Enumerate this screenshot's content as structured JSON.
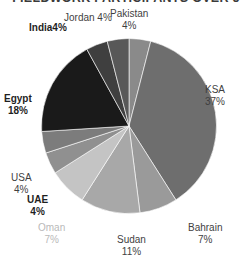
{
  "chart_data": {
    "type": "pie",
    "title": "FIELDWORK PARTICIPANTS OVER 5",
    "xlabel": "",
    "ylabel": "",
    "legend": "none",
    "labels_position": "outside",
    "value_unit": "%",
    "start_angle_deg": 0,
    "direction": "clockwise",
    "categories": [
      "Pakistan",
      "KSA",
      "Bahrain",
      "Sudan",
      "Oman",
      "UAE",
      "USA",
      "Egypt",
      "India",
      "Jordan"
    ],
    "values": [
      4,
      37,
      7,
      11,
      7,
      4,
      4,
      18,
      4,
      4
    ],
    "slices": [
      {
        "name": "Pakistan",
        "value": 4,
        "label": "Pakistan",
        "percent": "4%",
        "color": "#8a8a8a"
      },
      {
        "name": "KSA",
        "value": 37,
        "label": "KSA",
        "percent": "37%",
        "color": "#6e6e6e"
      },
      {
        "name": "Bahrain",
        "value": 7,
        "label": "Bahrain",
        "percent": "7%",
        "color": "#9a9a9a"
      },
      {
        "name": "Sudan",
        "value": 11,
        "label": "Sudan",
        "percent": "11%",
        "color": "#a8a8a8"
      },
      {
        "name": "Oman",
        "value": 7,
        "label": "Oman",
        "percent": "7%",
        "color": "#c4c4c4"
      },
      {
        "name": "UAE",
        "value": 4,
        "label": "UAE",
        "percent": "4%",
        "color": "#909090"
      },
      {
        "name": "USA",
        "value": 4,
        "label": "USA",
        "percent": "4%",
        "color": "#7c7c7c"
      },
      {
        "name": "Egypt",
        "value": 18,
        "label": "Egypt",
        "percent": "18%",
        "color": "#1a1a1a"
      },
      {
        "name": "India",
        "value": 4,
        "label": "India",
        "percent": "4%",
        "color": "#3f3f3f"
      },
      {
        "name": "Jordan",
        "value": 4,
        "label": "Jordan",
        "percent": "4%",
        "color": "#585858"
      }
    ]
  },
  "labels": {
    "jordan": {
      "name": "Jordan",
      "percent": "4%"
    },
    "pakistan": {
      "name": "Pakistan",
      "percent": "4%"
    },
    "india": {
      "name": "India",
      "percent": "4%"
    },
    "ksa": {
      "name": "KSA",
      "percent": "37%"
    },
    "egypt": {
      "name": "Egypt",
      "percent": "18%"
    },
    "usa": {
      "name": "USA",
      "percent": "4%"
    },
    "uae": {
      "name": "UAE",
      "percent": "4%"
    },
    "oman": {
      "name": "Oman",
      "percent": "7%"
    },
    "sudan": {
      "name": "Sudan",
      "percent": "11%"
    },
    "bahrain": {
      "name": "Bahrain",
      "percent": "7%"
    }
  }
}
